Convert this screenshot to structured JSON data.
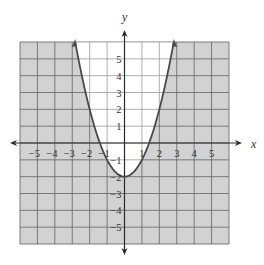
{
  "chart_data": {
    "type": "line",
    "title": "",
    "equation": "y = x^2 - 2",
    "inequality_shading": "region outside the parabola (below the curve) shaded",
    "xlabel": "x",
    "ylabel": "y",
    "xlim": [
      -6,
      6
    ],
    "ylim": [
      -6,
      6
    ],
    "grid": true,
    "x_ticks": [
      -5,
      -4,
      -3,
      -2,
      -1,
      1,
      2,
      3,
      4,
      5
    ],
    "y_ticks": [
      -5,
      -4,
      -3,
      -1,
      1,
      2,
      3,
      4,
      5
    ],
    "x_tick_labels": [
      "−5",
      "−4",
      "−3",
      "−2",
      "−1",
      "1",
      "2",
      "3",
      "4",
      "5"
    ],
    "y_tick_labels": [
      "5",
      "4",
      "3",
      "2",
      "1",
      "−1",
      "−2",
      "−3",
      "−4",
      "−5"
    ],
    "series": [
      {
        "name": "parabola",
        "vertex": [
          0,
          -2
        ],
        "x": [
          -2.83,
          -2,
          -1.41,
          -1,
          0,
          1,
          1.41,
          2,
          2.83
        ],
        "y": [
          6,
          2,
          0,
          -1,
          -2,
          -1,
          0,
          2,
          6
        ],
        "line_style": "solid",
        "arrows_at_ends": true
      }
    ],
    "colors": {
      "shaded": "#d2d2d2",
      "unshaded": "#ffffff",
      "grid_line_shaded": "#6e6e6e",
      "grid_line_unshaded": "#9a9a9a",
      "curve": "#4a4a4a",
      "axis": "#2a2a2a"
    }
  },
  "axes": {
    "x_label": "x",
    "y_label": "y"
  }
}
